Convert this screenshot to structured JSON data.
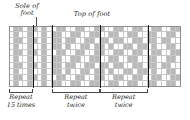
{
  "labels": {
    "sole": "Sole of\nfoot",
    "sole_line1": "Sole of",
    "sole_line2": "foot",
    "top": "Top of foot"
  },
  "repeats": [
    {
      "line1": "Repeat",
      "line2": "15 times"
    },
    {
      "line1": "Repeat",
      "line2": "twice"
    },
    {
      "line1": "Repeat",
      "line2": "twice"
    }
  ],
  "colors": {
    "filled": "#b9b9b9",
    "empty": "#ffffff",
    "gridline": "#c8c8c8",
    "divider": "#111111",
    "frame": "#8f8f8f",
    "text": "#1b1b1b"
  },
  "chart_data": {
    "type": "heatmap",
    "xlabel": "",
    "ylabel": "",
    "rows": 10,
    "columns": 36,
    "legend": [
      "filled = contrast color",
      "empty = main color"
    ],
    "divider_columns": [
      5,
      9,
      19,
      29
    ],
    "grid": [
      [
        0,
        1,
        1,
        0,
        1,
        1,
        0,
        1,
        0,
        0,
        1,
        1,
        0,
        0,
        1,
        1,
        0,
        0,
        1,
        1,
        0,
        0,
        1,
        1,
        0,
        0,
        1,
        1,
        0,
        0,
        1,
        1,
        0,
        0,
        1,
        1
      ],
      [
        0,
        1,
        0,
        0,
        1,
        0,
        0,
        1,
        0,
        1,
        1,
        0,
        0,
        1,
        1,
        0,
        0,
        1,
        1,
        0,
        0,
        1,
        1,
        0,
        0,
        1,
        1,
        0,
        0,
        1,
        1,
        0,
        0,
        1,
        1,
        0
      ],
      [
        0,
        1,
        1,
        0,
        1,
        1,
        0,
        1,
        0,
        1,
        1,
        0,
        1,
        1,
        0,
        0,
        1,
        1,
        0,
        1,
        1,
        0,
        1,
        1,
        0,
        0,
        1,
        1,
        0,
        1,
        1,
        0,
        1,
        1,
        0,
        0
      ],
      [
        0,
        1,
        0,
        0,
        1,
        0,
        0,
        1,
        0,
        1,
        1,
        0,
        1,
        0,
        0,
        1,
        1,
        0,
        1,
        1,
        0,
        1,
        0,
        0,
        1,
        1,
        0,
        1,
        1,
        0,
        1,
        0,
        0,
        1,
        1,
        0
      ],
      [
        0,
        1,
        1,
        0,
        1,
        1,
        0,
        1,
        0,
        0,
        1,
        1,
        0,
        0,
        1,
        1,
        0,
        0,
        1,
        1,
        0,
        0,
        1,
        1,
        0,
        0,
        1,
        1,
        0,
        0,
        1,
        1,
        0,
        0,
        1,
        1
      ],
      [
        0,
        1,
        0,
        0,
        1,
        0,
        0,
        1,
        0,
        1,
        1,
        0,
        0,
        1,
        1,
        0,
        0,
        1,
        1,
        0,
        0,
        1,
        1,
        0,
        0,
        1,
        1,
        0,
        0,
        1,
        1,
        0,
        0,
        1,
        1,
        0
      ],
      [
        0,
        1,
        1,
        0,
        1,
        1,
        0,
        1,
        0,
        1,
        1,
        0,
        1,
        1,
        0,
        0,
        1,
        1,
        0,
        1,
        1,
        0,
        1,
        1,
        0,
        0,
        1,
        1,
        0,
        1,
        1,
        0,
        1,
        1,
        0,
        0
      ],
      [
        0,
        1,
        0,
        0,
        1,
        0,
        0,
        1,
        0,
        1,
        1,
        0,
        1,
        0,
        0,
        1,
        1,
        0,
        1,
        1,
        0,
        1,
        0,
        0,
        1,
        1,
        0,
        1,
        1,
        0,
        1,
        0,
        0,
        1,
        1,
        0
      ],
      [
        0,
        1,
        1,
        0,
        1,
        1,
        0,
        1,
        0,
        0,
        1,
        1,
        0,
        0,
        1,
        1,
        0,
        0,
        1,
        1,
        0,
        0,
        1,
        1,
        0,
        0,
        1,
        1,
        0,
        0,
        1,
        1,
        0,
        0,
        1,
        1
      ],
      [
        0,
        1,
        0,
        0,
        1,
        0,
        0,
        1,
        0,
        1,
        1,
        0,
        0,
        1,
        1,
        0,
        0,
        1,
        1,
        0,
        0,
        1,
        1,
        0,
        0,
        1,
        1,
        0,
        0,
        1,
        1,
        0,
        0,
        1,
        1,
        0
      ]
    ]
  }
}
